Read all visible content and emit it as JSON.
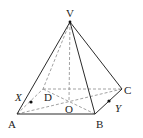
{
  "diagram": {
    "type": "square-based pyramid",
    "labels": {
      "apex": "V",
      "a": "A",
      "b": "B",
      "c": "C",
      "d": "D",
      "center": "O",
      "x": "X",
      "y": "Y"
    },
    "solid_edges": [
      "VA",
      "VB",
      "VC",
      "AB",
      "BC"
    ],
    "hidden_edges": [
      "VD",
      "VO",
      "AD",
      "DC",
      "AC",
      "BD"
    ],
    "points": [
      "X on VA",
      "Y on BC"
    ]
  }
}
